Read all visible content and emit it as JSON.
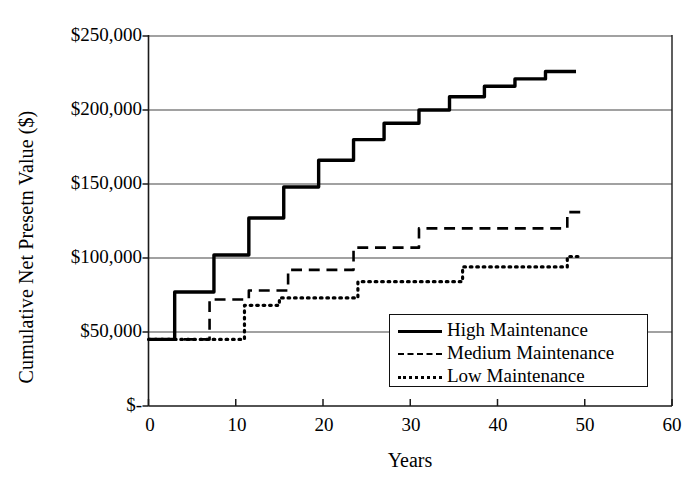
{
  "chart_data": {
    "type": "line",
    "subtype": "step",
    "title": "",
    "xlabel": "Years",
    "ylabel": "Cumulative Net Presetn Value ($)",
    "xlim": [
      0,
      60
    ],
    "ylim": [
      0,
      250000
    ],
    "grid": "horizontal",
    "legend_position": "lower-right-inside",
    "x_ticks": [
      0,
      10,
      20,
      30,
      40,
      50,
      60
    ],
    "x_tick_labels": [
      "0",
      "10",
      "20",
      "30",
      "40",
      "50",
      "60"
    ],
    "y_ticks": [
      0,
      50000,
      100000,
      150000,
      200000,
      250000
    ],
    "y_tick_labels": [
      "$-",
      "$50,000",
      "$100,000",
      "$150,000",
      "$200,000",
      "$250,000"
    ],
    "series": [
      {
        "name": "High Maintenance",
        "style": "solid",
        "color": "#000000",
        "width": 3.4,
        "x": [
          0,
          3,
          3,
          7.5,
          7.5,
          11.5,
          11.5,
          15.5,
          15.5,
          19.5,
          19.5,
          23.5,
          23.5,
          27,
          27,
          31,
          31,
          34.5,
          34.5,
          38.5,
          38.5,
          42,
          42,
          45.5,
          45.5,
          49
        ],
        "y": [
          45000,
          45000,
          77000,
          77000,
          102000,
          102000,
          127000,
          127000,
          148000,
          148000,
          166000,
          166000,
          180000,
          180000,
          191000,
          191000,
          200000,
          200000,
          209000,
          209000,
          216000,
          216000,
          221000,
          221000,
          226000,
          226000
        ]
      },
      {
        "name": "Medium Maintenance",
        "style": "dashed",
        "color": "#000000",
        "width": 2.6,
        "x": [
          0,
          7,
          7,
          11.5,
          11.5,
          16,
          16,
          23.5,
          23.5,
          31,
          31,
          48,
          48,
          50
        ],
        "y": [
          45000,
          45000,
          72000,
          72000,
          78000,
          78000,
          92000,
          92000,
          107000,
          107000,
          120000,
          120000,
          131000,
          131000
        ]
      },
      {
        "name": "Low Maintenance",
        "style": "dotted",
        "color": "#000000",
        "width": 3.2,
        "x": [
          0,
          11,
          11,
          15,
          15,
          24,
          24,
          36,
          36,
          48,
          48,
          49.5
        ],
        "y": [
          45000,
          45000,
          68000,
          68000,
          73000,
          73000,
          84000,
          84000,
          94000,
          94000,
          101000,
          101000
        ]
      }
    ],
    "legend": [
      {
        "label": "High Maintenance",
        "style": "solid"
      },
      {
        "label": "Medium Maintenance",
        "style": "dashed"
      },
      {
        "label": "Low Maintenance",
        "style": "dotted"
      }
    ]
  }
}
